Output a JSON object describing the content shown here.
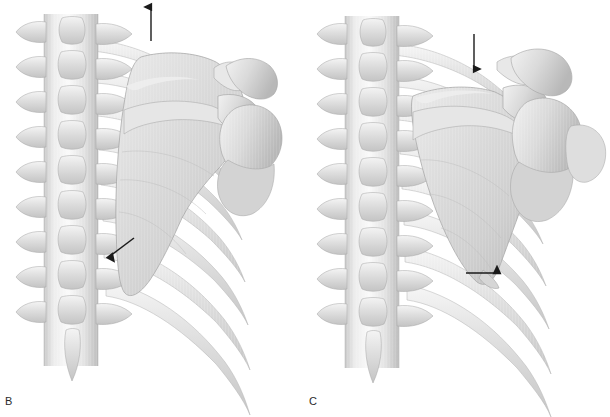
{
  "figure": {
    "type": "anatomical-illustration",
    "view": "posterior",
    "rendering": "grayscale-airbrush-medical-illustration",
    "background_color": "#ffffff",
    "bone_colors": {
      "highlight": "#fbfbfb",
      "light": "#eeeeee",
      "mid": "#d8d8d8",
      "shade": "#c2c2c2",
      "deep_shade": "#ababab",
      "outline": "#9a9a9a"
    },
    "arrow_color": "#1a1a1a",
    "width": 610,
    "height": 417
  },
  "panels": [
    {
      "id": "B",
      "label": "B",
      "label_x": 5,
      "label_y": 400,
      "caption_motion": "elevation",
      "structures": [
        "thoracic-vertebral-column",
        "transverse-processes",
        "spinous-processes",
        "ribs",
        "scapula",
        "scapular-spine",
        "acromion",
        "coracoid-process",
        "clavicle",
        "glenohumeral-head",
        "inferior-angle-of-scapula"
      ],
      "arrows": [
        {
          "name": "elevation-arrow",
          "direction": "up",
          "meaning": "scapula moves superiorly (elevation)",
          "x1": 151,
          "y1": 41,
          "x2": 151,
          "y2": 5
        },
        {
          "name": "inferior-angle-pointer-arrow",
          "direction": "down-left",
          "meaning": "points to medial border / rib relationship",
          "x1": 134,
          "y1": 238,
          "x2": 108,
          "y2": 257
        }
      ]
    },
    {
      "id": "C",
      "label": "C",
      "label_x": 303,
      "label_y": 400,
      "caption_motion": "depression",
      "structures": [
        "thoracic-vertebral-column",
        "transverse-processes",
        "spinous-processes",
        "ribs",
        "scapula",
        "scapular-spine",
        "acromion",
        "coracoid-process",
        "clavicle",
        "glenohumeral-head",
        "inferior-angle-of-scapula"
      ],
      "arrows": [
        {
          "name": "depression-arrow",
          "direction": "down",
          "meaning": "scapula moves inferiorly (depression)",
          "x1": 474,
          "y1": 34,
          "x2": 474,
          "y2": 71
        },
        {
          "name": "inferior-angle-pointer-arrow",
          "direction": "right",
          "meaning": "points to inferior angle of scapula",
          "x1": 466,
          "y1": 273,
          "x2": 499,
          "y2": 273
        }
      ]
    }
  ]
}
